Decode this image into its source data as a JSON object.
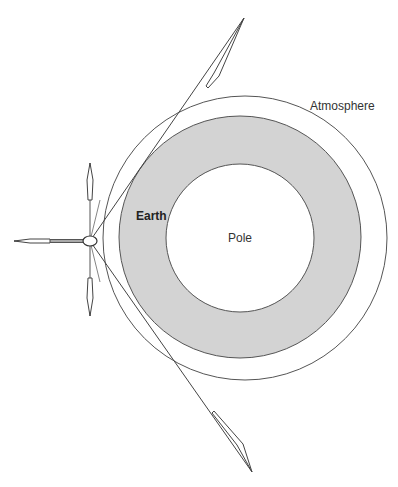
{
  "diagram": {
    "labels": {
      "atmosphere": "Atmosphere",
      "earth": "Earth",
      "pole": "Pole"
    },
    "colors": {
      "earth_fill": "#d3d3d3",
      "line": "#555555",
      "background": "#ffffff"
    },
    "shapes": {
      "atmosphere_circle": {
        "cx": 245,
        "cy": 238,
        "r": 142
      },
      "earth_ring": {
        "cx": 240,
        "cy": 237,
        "r": 121
      },
      "pole_circle": {
        "cx": 240,
        "cy": 238,
        "r": 74
      },
      "satellite": {
        "cx": 90,
        "cy": 241,
        "rx": 7,
        "ry": 5
      }
    },
    "arrows": [
      {
        "name": "upper-tangent-arrow",
        "from": [
          90,
          241
        ],
        "to": [
          244,
          18
        ]
      },
      {
        "name": "lower-tangent-arrow",
        "from": [
          90,
          241
        ],
        "to": [
          252,
          472
        ]
      },
      {
        "name": "up-arrow",
        "from": [
          90,
          241
        ],
        "to": [
          90,
          165
        ]
      },
      {
        "name": "down-arrow",
        "from": [
          90,
          241
        ],
        "to": [
          90,
          315
        ]
      },
      {
        "name": "left-arrow",
        "from": [
          90,
          241
        ],
        "to": [
          15,
          241
        ]
      }
    ]
  }
}
